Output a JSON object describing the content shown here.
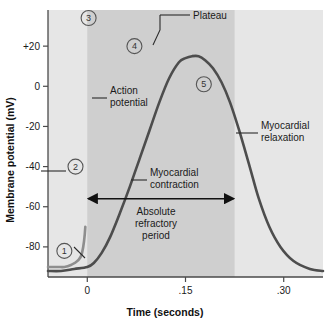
{
  "figure": {
    "background_color": "#ffffff"
  },
  "axes": {
    "y_title": "Membrane potential (mV)",
    "x_title": "Time (seconds)",
    "y_ticks": [
      "+20",
      "0",
      "-20",
      "-40",
      "-60",
      "-80"
    ],
    "y_tick_values": [
      20,
      0,
      -20,
      -40,
      -60,
      -80
    ],
    "x_ticks": [
      "0",
      ".15",
      ".30"
    ],
    "x_tick_values": [
      0,
      0.15,
      0.3
    ]
  },
  "annotations": {
    "plateau": "Plateau",
    "action_potential": "Action\npotential",
    "action_potential_line1": "Action",
    "action_potential_line2": "potential",
    "myocardial_relaxation_line1": "Myocardial",
    "myocardial_relaxation_line2": "relaxation",
    "myocardial_contraction_line1": "Myocardial",
    "myocardial_contraction_line2": "contraction",
    "absolute_refractory_line1": "Absolute",
    "absolute_refractory_line2": "refractory",
    "absolute_refractory_line3": "period"
  },
  "markers": [
    {
      "label": "1",
      "x": -0.035,
      "y": -82
    },
    {
      "label": "2",
      "x": -0.018,
      "y": -40
    },
    {
      "label": "3",
      "x": 0.002,
      "y": 34
    },
    {
      "label": "4",
      "x": 0.072,
      "y": 20
    },
    {
      "label": "5",
      "x": 0.178,
      "y": 1
    }
  ],
  "colors": {
    "action_potential_curve": "#8e8e8e",
    "contraction_curve": "#4d4d4d",
    "shade_light": "#e6e6e6",
    "shade_dark": "#cfcfcf",
    "axis": "#4a4a4a",
    "text": "#1a1a1a"
  },
  "chart_data": {
    "type": "line",
    "xlabel": "Time (seconds)",
    "ylabel": "Membrane potential (mV)",
    "xlim": [
      -0.06,
      0.36
    ],
    "ylim": [
      -95,
      38
    ],
    "grid": false,
    "legend": "none",
    "shaded_regions": [
      {
        "name": "plot-background",
        "x_start": -0.06,
        "x_end": 0.36,
        "color": "#e6e6e6"
      },
      {
        "name": "absolute-refractory-period",
        "x_start": 0.0,
        "x_end": 0.225,
        "color": "#cfcfcf"
      }
    ],
    "annotation_spans": [
      {
        "name": "absolute-refractory-period-arrow",
        "x_start": 0.0,
        "x_end": 0.225,
        "y": -56
      }
    ],
    "series": [
      {
        "name": "Action potential",
        "color": "#8e8e8e",
        "x": [
          -0.06,
          -0.045,
          -0.035,
          -0.025,
          -0.015,
          -0.008,
          -0.003,
          0.0,
          0.0,
          0.004,
          0.01,
          0.018,
          0.028,
          0.04,
          0.055,
          0.07,
          0.085,
          0.1,
          0.115,
          0.13,
          0.145,
          0.158,
          0.168,
          0.178,
          0.188,
          0.196,
          0.203,
          0.21,
          0.218,
          0.228,
          0.24,
          0.26,
          0.29,
          0.33,
          0.36
        ],
        "y": [
          -90,
          -90,
          -90,
          -89,
          -87,
          -83,
          -70,
          -40,
          28,
          26,
          23,
          21,
          20,
          19,
          18,
          17,
          16,
          14,
          12,
          10,
          8,
          5,
          1,
          -6,
          -18,
          -32,
          -46,
          -58,
          -70,
          -80,
          -86,
          -89,
          -89,
          -89,
          -89
        ]
      },
      {
        "name": "Myocardial contraction",
        "color": "#4d4d4d",
        "x": [
          -0.06,
          -0.04,
          -0.02,
          0.0,
          0.01,
          0.022,
          0.035,
          0.05,
          0.065,
          0.08,
          0.095,
          0.11,
          0.125,
          0.14,
          0.15,
          0.16,
          0.17,
          0.18,
          0.192,
          0.205,
          0.218,
          0.232,
          0.248,
          0.262,
          0.278,
          0.295,
          0.315,
          0.34,
          0.36
        ],
        "y": [
          -92,
          -92,
          -91,
          -90,
          -88,
          -83,
          -75,
          -63,
          -50,
          -36,
          -22,
          -8,
          4,
          12,
          14,
          15,
          15,
          13,
          9,
          2,
          -8,
          -22,
          -40,
          -56,
          -70,
          -80,
          -87,
          -91,
          -92
        ]
      }
    ],
    "key_points": [
      {
        "label": "1",
        "description": "Resting membrane potential",
        "x": -0.035,
        "y": -82
      },
      {
        "label": "2",
        "description": "Threshold / depolarization",
        "x": -0.018,
        "y": -40
      },
      {
        "label": "3",
        "description": "Peak of rapid depolarization",
        "x": 0.002,
        "y": 34
      },
      {
        "label": "4",
        "description": "Plateau phase",
        "x": 0.072,
        "y": 20
      },
      {
        "label": "5",
        "description": "Repolarization",
        "x": 0.178,
        "y": 1
      }
    ]
  }
}
